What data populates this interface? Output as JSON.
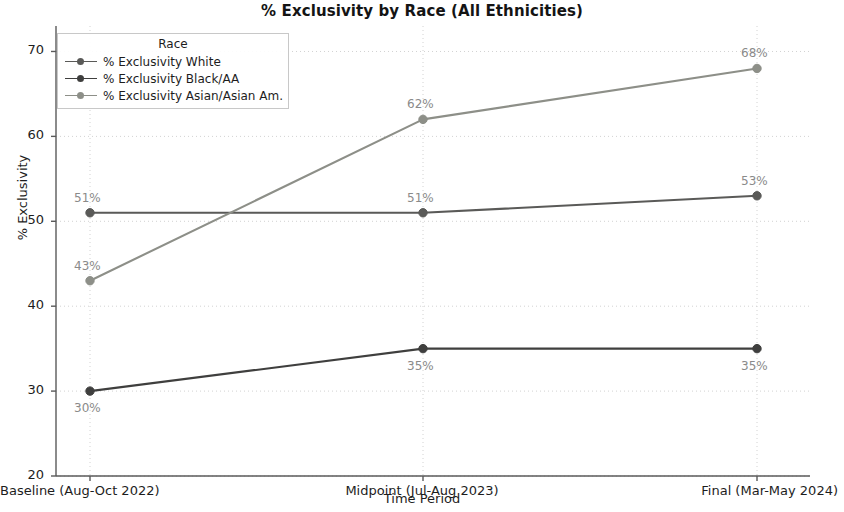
{
  "chart_data": {
    "type": "line",
    "title": "% Exclusivity by Race (All Ethnicities)",
    "xlabel": "Time Period",
    "ylabel": "% Exclusivity",
    "categories": [
      "Baseline (Aug-Oct 2022)",
      "Midpoint (Jul-Aug 2023)",
      "Final (Mar-May 2024)"
    ],
    "ylim": [
      20,
      73
    ],
    "yticks": [
      20,
      30,
      40,
      50,
      60,
      70
    ],
    "ytick_labels": [
      "20",
      "30",
      "40",
      "50",
      "60",
      "70"
    ],
    "grid": true,
    "legend_position": "upper left",
    "legend_title": "Race",
    "series": [
      {
        "name": "% Exclusivity White",
        "color": "#5a5a58",
        "values": [
          51,
          51,
          53
        ],
        "point_labels": [
          "51%",
          "51%",
          "53%"
        ]
      },
      {
        "name": "% Exclusivity Black/AA",
        "color": "#3f3f3e",
        "values": [
          30,
          35,
          35
        ],
        "point_labels": [
          "30%",
          "35%",
          "35%"
        ]
      },
      {
        "name": "% Exclusivity Asian/Asian Am.",
        "color": "#8d8f88",
        "values": [
          43,
          62,
          68
        ],
        "point_labels": [
          "43%",
          "62%",
          "68%"
        ]
      }
    ]
  },
  "axis_style": {
    "spine_color": "#5a5a5a",
    "grid_color": "#d2d2d2",
    "label_color": "#8a8a8a"
  }
}
